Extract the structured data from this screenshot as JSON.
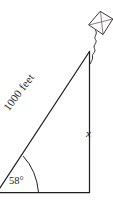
{
  "figure": {
    "type": "right-triangle-kite-diagram",
    "background_color": "#ffffff",
    "stroke_color": "#23201f",
    "labels": {
      "hypotenuse": "1000 feet",
      "angle": "58°",
      "opposite_side": "x"
    },
    "geometry": {
      "left_vertex": [
        -2,
        192
      ],
      "right_vertex": [
        89,
        192
      ],
      "apex_vertex": [
        89,
        51
      ],
      "angle_degrees": 58,
      "hypotenuse_length_label": "1000 feet",
      "unknown_side_label": "x",
      "right_angle_at": "right_vertex"
    },
    "kite": {
      "name": "kite",
      "center": [
        100,
        23
      ],
      "width": 25,
      "height": 24,
      "has_cross_brace": true,
      "tail": "wavy-string"
    }
  }
}
